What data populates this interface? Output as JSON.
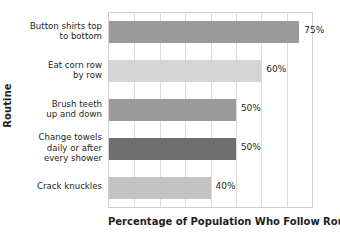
{
  "chart_data": {
    "type": "bar",
    "orientation": "horizontal",
    "title": "",
    "xlabel": "Percentage of Population Who Follow Routine",
    "ylabel": "Routine",
    "xlim": [
      0,
      80
    ],
    "xtick_step": 10,
    "grid": true,
    "legend": false,
    "categories": [
      "Button shirts top to bottom",
      "Eat corn row by row",
      "Brush teeth up and down",
      "Change towels daily or after every shower",
      "Crack knuckles"
    ],
    "values": [
      75,
      60,
      50,
      50,
      40
    ],
    "value_labels": [
      "75%",
      "60%",
      "50%",
      "50%",
      "40%"
    ],
    "bar_colors": [
      "#9a9a9a",
      "#d5d5d5",
      "#9a9a9a",
      "#6f6f6f",
      "#c3c3c3"
    ]
  },
  "axes": {
    "y_title": "Routine",
    "x_title": "Percentage of Population Who Follow Routine"
  },
  "category_label_lines": [
    [
      "Button shirts top",
      "to bottom"
    ],
    [
      "Eat corn row",
      "by row"
    ],
    [
      "Brush teeth",
      "up and down"
    ],
    [
      "Change towels",
      "daily or after",
      "every shower"
    ],
    [
      "Crack knuckles"
    ]
  ],
  "style": {
    "plot_border_color": "#cfcfcf",
    "gridline_color": "#dcdcdc",
    "text_color": "#231f20",
    "background": "#ffffff"
  }
}
